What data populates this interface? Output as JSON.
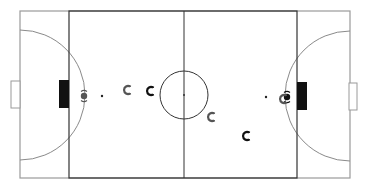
{
  "diagram": {
    "type": "futsal-field-formation",
    "colors": {
      "background": "#ffffff",
      "outer_line": "#9a9a9a",
      "inner_line": "#333333",
      "goal_area_fill": "#111111",
      "player_light": "#555555",
      "player_dark": "#111111"
    },
    "field": {
      "outer": {
        "x": 20,
        "y": 11,
        "w": 330,
        "h": 167
      },
      "inner": {
        "x": 69,
        "y": 11,
        "w": 228,
        "h": 167
      },
      "center_line_x": 184,
      "center_circle": {
        "cx": 184,
        "cy": 95,
        "r": 24
      },
      "center_spot": {
        "cx": 184,
        "cy": 95
      },
      "left_goal_box": {
        "x": 11,
        "y": 81,
        "w": 9,
        "h": 27
      },
      "right_goal_box": {
        "x": 349,
        "y": 83,
        "w": 8,
        "h": 27
      },
      "left_goal_area": {
        "x": 59,
        "y": 80,
        "w": 10,
        "h": 28
      },
      "right_goal_area": {
        "x": 297,
        "y": 82,
        "w": 10,
        "h": 28
      },
      "left_arc": {
        "cx": 20,
        "cy": 95,
        "r": 65
      },
      "right_arc": {
        "cx": 350,
        "cy": 96,
        "r": 65
      },
      "left_penalty_spot": {
        "cx": 102,
        "cy": 96
      },
      "right_penalty_spot": {
        "cx": 266,
        "cy": 97
      }
    },
    "players": [
      {
        "id": "gk-left",
        "team": "light",
        "x": 84,
        "y": 96,
        "role": "goalkeeper"
      },
      {
        "id": "p1",
        "team": "light",
        "x": 127,
        "y": 90,
        "role": "field"
      },
      {
        "id": "p2",
        "team": "dark",
        "x": 150,
        "y": 91,
        "role": "field"
      },
      {
        "id": "p3",
        "team": "light",
        "x": 211,
        "y": 117,
        "role": "field"
      },
      {
        "id": "p4",
        "team": "dark",
        "x": 246,
        "y": 136,
        "role": "field"
      },
      {
        "id": "gk-right",
        "team": "dark",
        "x": 287,
        "y": 97,
        "role": "goalkeeper"
      },
      {
        "id": "p5",
        "team": "light",
        "x": 283,
        "y": 99,
        "role": "field"
      }
    ]
  }
}
